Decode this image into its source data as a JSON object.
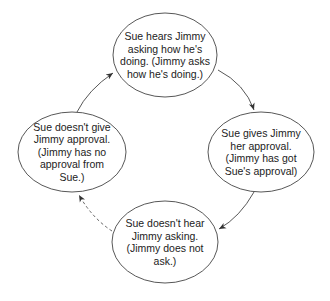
{
  "diagram": {
    "type": "cycle",
    "nodes": [
      {
        "id": "top",
        "label": "Sue hears Jimmy asking how he's doing. (Jimmy asks how he's doing.)",
        "cx": 165,
        "cy": 55,
        "rx": 52,
        "ry": 42
      },
      {
        "id": "right",
        "label": "Sue gives Jimmy her approval. (Jimmy has got Sue's approval)",
        "cx": 261,
        "cy": 152,
        "rx": 53,
        "ry": 40
      },
      {
        "id": "bottom",
        "label": "Sue doesn't hear Jimmy asking. (Jimmy does not ask.)",
        "cx": 165,
        "cy": 242,
        "rx": 53,
        "ry": 41
      },
      {
        "id": "left",
        "label": "Sue doesn't give Jimmy approval. (Jimmy has no approval from Sue.)",
        "cx": 72,
        "cy": 152,
        "rx": 54,
        "ry": 40
      }
    ],
    "edges": [
      {
        "from": "top",
        "to": "right",
        "style": "solid"
      },
      {
        "from": "right",
        "to": "bottom",
        "style": "solid"
      },
      {
        "from": "bottom",
        "to": "left",
        "style": "dashed"
      },
      {
        "from": "left",
        "to": "top",
        "style": "solid"
      }
    ],
    "colors": {
      "stroke": "#333333",
      "text": "#222222",
      "background": "#ffffff"
    }
  }
}
